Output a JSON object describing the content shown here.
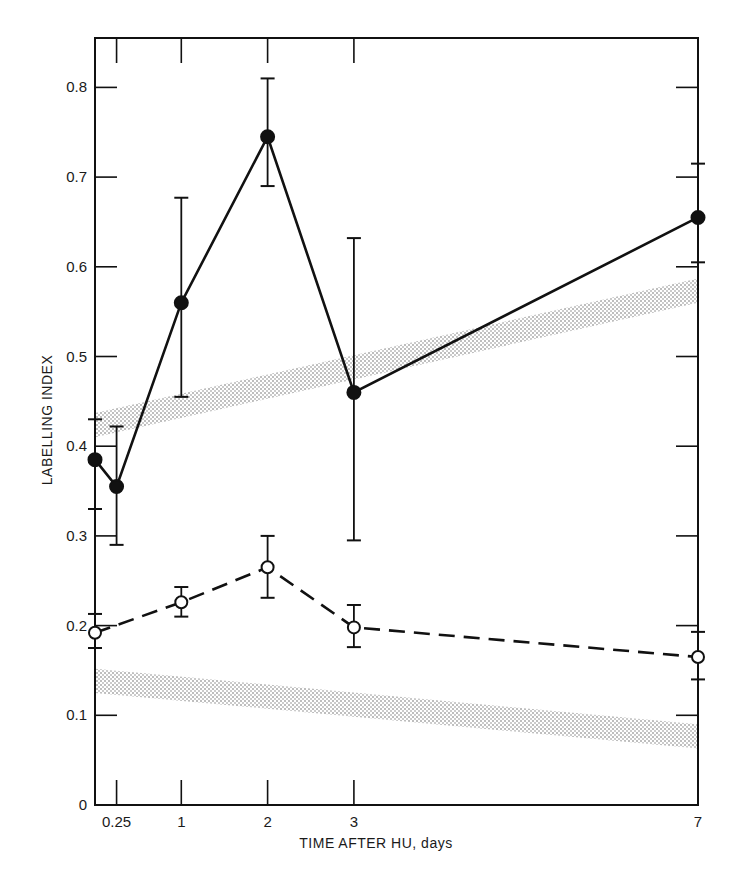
{
  "chart_data": {
    "type": "line",
    "title": "",
    "xlabel": "TIME AFTER HU, days",
    "ylabel": "LABELLING INDEX",
    "ylim": [
      0,
      0.85
    ],
    "x_ticks": [
      {
        "label": "0.25",
        "value": 0.25
      },
      {
        "label": "1",
        "value": 1
      },
      {
        "label": "2",
        "value": 2
      },
      {
        "label": "3",
        "value": 3
      },
      {
        "label": "7",
        "value": 7
      }
    ],
    "y_ticks": [
      {
        "label": "0",
        "value": 0
      },
      {
        "label": "0.1",
        "value": 0.1
      },
      {
        "label": "0.2",
        "value": 0.2
      },
      {
        "label": "0.3",
        "value": 0.3
      },
      {
        "label": "0.4",
        "value": 0.4
      },
      {
        "label": "0.5",
        "value": 0.5
      },
      {
        "label": "0.6",
        "value": 0.6
      },
      {
        "label": "0.7",
        "value": 0.7
      },
      {
        "label": "0.8",
        "value": 0.8
      }
    ],
    "grid": false,
    "legend": null,
    "series": [
      {
        "name": "filled circles",
        "marker": "filled-circle",
        "line": "solid",
        "points": [
          {
            "x": 0.0,
            "y": 0.385,
            "err_low": 0.33,
            "err_high": 0.43
          },
          {
            "x": 0.25,
            "y": 0.355,
            "err_low": 0.29,
            "err_high": 0.422
          },
          {
            "x": 1,
            "y": 0.56,
            "err_low": 0.455,
            "err_high": 0.677
          },
          {
            "x": 2,
            "y": 0.745,
            "err_low": 0.69,
            "err_high": 0.81
          },
          {
            "x": 3,
            "y": 0.46,
            "err_low": 0.295,
            "err_high": 0.632
          },
          {
            "x": 7,
            "y": 0.655,
            "err_low": 0.605,
            "err_high": 0.715
          }
        ]
      },
      {
        "name": "open circles",
        "marker": "open-circle",
        "line": "dashed",
        "points": [
          {
            "x": 0.0,
            "y": 0.192,
            "err_low": 0.175,
            "err_high": 0.213
          },
          {
            "x": 1,
            "y": 0.226,
            "err_low": 0.21,
            "err_high": 0.243
          },
          {
            "x": 2,
            "y": 0.265,
            "err_low": 0.231,
            "err_high": 0.3
          },
          {
            "x": 3,
            "y": 0.198,
            "err_low": 0.176,
            "err_high": 0.223
          },
          {
            "x": 7,
            "y": 0.165,
            "err_low": 0.14,
            "err_high": 0.193
          }
        ]
      }
    ],
    "bands": [
      {
        "name": "upper control band",
        "x_start": 0,
        "x_end": 7,
        "y_start": [
          0.41,
          0.437
        ],
        "y_end": [
          0.56,
          0.587
        ]
      },
      {
        "name": "lower control band",
        "x_start": 0,
        "x_end": 7,
        "y_start": [
          0.125,
          0.152
        ],
        "y_end": [
          0.063,
          0.09
        ]
      }
    ]
  },
  "axes": {
    "xlabel": "TIME AFTER HU, days",
    "ylabel": "LABELLING INDEX"
  }
}
